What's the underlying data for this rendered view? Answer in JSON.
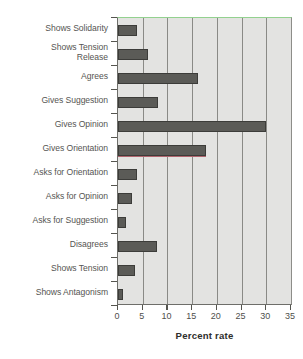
{
  "chart_data": {
    "type": "bar",
    "orientation": "horizontal",
    "title": "",
    "xlabel": "Percent rate",
    "ylabel": "",
    "xlim": [
      0,
      35
    ],
    "xticks": [
      0,
      5,
      10,
      15,
      20,
      25,
      30,
      35
    ],
    "grid": "vertical gridlines at every x tick",
    "legend": "none",
    "categories": [
      "Shows Solidarity",
      "Shows Tension Release",
      "Agrees",
      "Gives Suggestion",
      "Gives Opinion",
      "Gives Orientation",
      "Asks for Orientation",
      "Asks for Opinion",
      "Asks for Suggestion",
      "Disagrees",
      "Shows Tension",
      "Shows Antagonism"
    ],
    "category_labels_wrapped": [
      [
        "Shows Solidarity"
      ],
      [
        "Shows Tension",
        "Release"
      ],
      [
        "Agrees"
      ],
      [
        "Gives Suggestion"
      ],
      [
        "Gives Opinion"
      ],
      [
        "Gives Orientation"
      ],
      [
        "Asks for Orientation"
      ],
      [
        "Asks for Opinion"
      ],
      [
        "Asks for Suggestion"
      ],
      [
        "Disagrees"
      ],
      [
        "Shows Tension"
      ],
      [
        "Shows Antagonism"
      ]
    ],
    "values": [
      3.9,
      6.1,
      16.2,
      8.0,
      29.9,
      17.9,
      3.9,
      2.8,
      1.7,
      7.9,
      3.4,
      1.1
    ],
    "annotations": [
      {
        "category": "Gives Orientation",
        "type": "underline",
        "color": "#b0656e"
      }
    ],
    "colors": {
      "bar_fill": "#5b5b57",
      "bar_outline": "#3c3c39",
      "plot_background": "#e3e3e1",
      "gridline": "#8a8a86",
      "axis": "#55554f",
      "top_border": "#93d18f",
      "label_text": "#555552",
      "tick_text": "#4f4f4c",
      "axis_title_text": "#2e2e2c"
    }
  }
}
